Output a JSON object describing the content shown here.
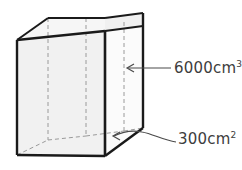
{
  "figure": {
    "shape": {
      "name": "rectangular-prism",
      "style": "isometric-wireframe-with-hidden-dashed-edges",
      "face_fill_front": "#f1f1f1",
      "face_fill_side": "#fafafa",
      "face_fill_top": "#f6f6f6",
      "edge_color": "#1a1a1a",
      "hidden_edge_color": "#9a9a9a",
      "hidden_edge_style": "dashed"
    },
    "callouts": [
      {
        "id": "volume",
        "value": "6000",
        "unit": "cm",
        "exponent": "3",
        "text": "6000cm",
        "pointer": "straight-arrow-left",
        "points_to": "right-face-interior"
      },
      {
        "id": "base-area",
        "value": "300",
        "unit": "cm",
        "exponent": "2",
        "text": "300cm",
        "pointer": "curved-arrow-left",
        "points_to": "bottom-face"
      }
    ],
    "colors": {
      "text": "#3d3d3d",
      "stroke": "#1a1a1a",
      "hidden": "#9a9a9a",
      "background": "#ffffff"
    }
  }
}
